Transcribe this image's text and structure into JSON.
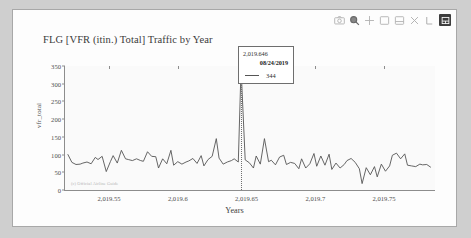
{
  "toolbar": {
    "items": [
      {
        "name": "camera-icon",
        "label": "Download plot as a png"
      },
      {
        "name": "zoom-icon",
        "label": "Zoom"
      },
      {
        "name": "pan-icon",
        "label": "Pan"
      },
      {
        "name": "zoom-in-box-icon",
        "label": "Box Select"
      },
      {
        "name": "lasso-icon",
        "label": "Lasso Select"
      },
      {
        "name": "zoom-out-icon",
        "label": "Zoom out"
      },
      {
        "name": "autoscale-icon",
        "label": "Autoscale"
      },
      {
        "name": "reset-axes-icon",
        "label": "Reset axes"
      }
    ]
  },
  "chart_data": {
    "type": "line",
    "title": "FLG [VFR (itin.) Total] Traffic by Year",
    "xlabel": "Years",
    "ylabel": "vfr_total",
    "xlim": [
      2019.518,
      2019.787
    ],
    "ylim": [
      0,
      350
    ],
    "xticks": [
      "2,019.55",
      "2,019.6",
      "2,019.65",
      "2,019.7",
      "2,019.75"
    ],
    "xtick_values": [
      2019.55,
      2019.6,
      2019.65,
      2019.7,
      2019.75
    ],
    "yticks": [
      "0",
      "50",
      "100",
      "150",
      "200",
      "250",
      "300",
      "350"
    ],
    "ytick_values": [
      0,
      50,
      100,
      150,
      200,
      250,
      300,
      350
    ],
    "grid": false,
    "legend": "none",
    "line_color": "#555555",
    "watermark": "(c) Official Airline Guide",
    "series": [
      {
        "name": "vfr_total",
        "x": [
          2019.52,
          2019.523,
          2019.526,
          2019.529,
          2019.531,
          2019.534,
          2019.537,
          2019.54,
          2019.542,
          2019.545,
          2019.548,
          2019.551,
          2019.553,
          2019.556,
          2019.559,
          2019.562,
          2019.564,
          2019.567,
          2019.57,
          2019.573,
          2019.575,
          2019.578,
          2019.581,
          2019.584,
          2019.586,
          2019.589,
          2019.592,
          2019.595,
          2019.597,
          2019.6,
          2019.603,
          2019.606,
          2019.608,
          2019.611,
          2019.614,
          2019.617,
          2019.619,
          2019.622,
          2019.625,
          2019.628,
          2019.63,
          2019.633,
          2019.636,
          2019.639,
          2019.641,
          2019.644,
          2019.646,
          2019.649,
          2019.652,
          2019.655,
          2019.657,
          2019.66,
          2019.663,
          2019.666,
          2019.668,
          2019.671,
          2019.674,
          2019.677,
          2019.679,
          2019.682,
          2019.685,
          2019.688,
          2019.69,
          2019.693,
          2019.696,
          2019.699,
          2019.701,
          2019.704,
          2019.707,
          2019.71,
          2019.712,
          2019.715,
          2019.718,
          2019.721,
          2019.723,
          2019.726,
          2019.729,
          2019.732,
          2019.734,
          2019.737,
          2019.74,
          2019.743,
          2019.745,
          2019.748,
          2019.751,
          2019.754,
          2019.756,
          2019.759,
          2019.762,
          2019.765,
          2019.767,
          2019.77,
          2019.773,
          2019.776,
          2019.778,
          2019.781,
          2019.784
        ],
        "y": [
          101,
          78,
          72,
          73,
          76,
          79,
          74,
          92,
          86,
          95,
          52,
          80,
          97,
          76,
          112,
          88,
          86,
          83,
          88,
          83,
          81,
          108,
          95,
          94,
          62,
          88,
          74,
          112,
          70,
          80,
          73,
          79,
          82,
          89,
          75,
          97,
          68,
          86,
          95,
          145,
          90,
          73,
          79,
          83,
          88,
          79,
          344,
          85,
          77,
          62,
          96,
          73,
          145,
          80,
          84,
          71,
          93,
          98,
          72,
          78,
          75,
          60,
          88,
          62,
          74,
          103,
          67,
          96,
          70,
          101,
          58,
          76,
          62,
          72,
          83,
          89,
          78,
          60,
          18,
          63,
          43,
          66,
          37,
          73,
          53,
          68,
          98,
          104,
          88,
          102,
          70,
          68,
          66,
          73,
          71,
          72,
          64
        ]
      }
    ],
    "cursor": {
      "x_value": 2019.646,
      "x_label": "2,019.646",
      "date_label": "08/24/2019",
      "value_label": "344",
      "value": 344
    }
  }
}
